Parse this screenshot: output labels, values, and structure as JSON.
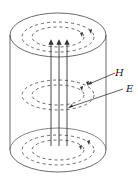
{
  "diagram": {
    "type": "cylinder-field-lines",
    "labels": {
      "h": "H",
      "e": "E"
    },
    "colors": {
      "stroke": "#333333",
      "background": "#ffffff"
    }
  }
}
